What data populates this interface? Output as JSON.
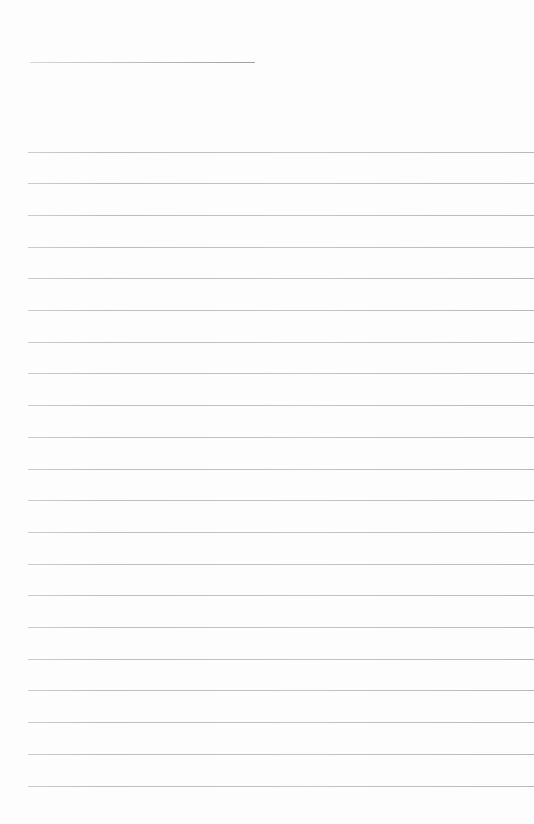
{
  "page": {
    "background": "#fdfdfd",
    "width": 534,
    "height": 824
  },
  "header_underline": {
    "left": 30,
    "top": 62,
    "width": 225,
    "thickness": 1,
    "color_left": "#d6d6d6",
    "color_right": "#9f9f9f"
  },
  "ruled_lines": {
    "count": 21,
    "first_top": 151.5,
    "spacing": 31.7,
    "left": 28,
    "right": 0,
    "thickness": 1,
    "color": "#c2c2c2"
  }
}
